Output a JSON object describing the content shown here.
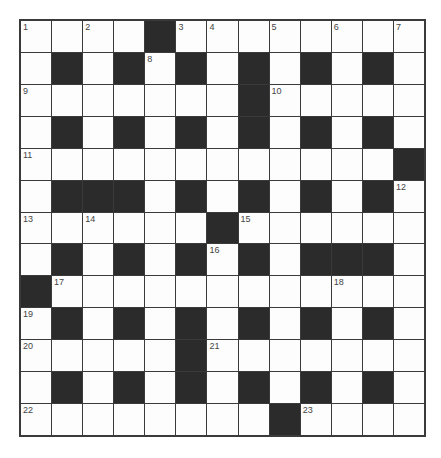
{
  "puzzle": {
    "type": "crossword",
    "rows": 13,
    "cols": 13,
    "colors": {
      "black_cell": "#2b2b2b",
      "white_cell": "#fdfdfd",
      "grid_line": "#3a3a3a",
      "number_text": "#444444"
    },
    "grid": [
      "....#........",
      ".#.#.#.#.#.#.",
      ".......#.....",
      ".#.#.#.#.#.#.",
      "............#",
      ".###.#.#.#.#.",
      "......#......",
      ".#.#.#.#.###.",
      "#............",
      ".#.#.#.#.#.#.",
      ".....#.......",
      ".#.#.#.#.#.#.",
      "........#...."
    ],
    "numbers": [
      {
        "row": 0,
        "col": 0,
        "n": "1"
      },
      {
        "row": 0,
        "col": 2,
        "n": "2"
      },
      {
        "row": 0,
        "col": 5,
        "n": "3"
      },
      {
        "row": 0,
        "col": 6,
        "n": "4"
      },
      {
        "row": 0,
        "col": 8,
        "n": "5"
      },
      {
        "row": 0,
        "col": 10,
        "n": "6"
      },
      {
        "row": 0,
        "col": 12,
        "n": "7"
      },
      {
        "row": 1,
        "col": 4,
        "n": "8"
      },
      {
        "row": 2,
        "col": 0,
        "n": "9"
      },
      {
        "row": 2,
        "col": 8,
        "n": "10"
      },
      {
        "row": 4,
        "col": 0,
        "n": "11"
      },
      {
        "row": 5,
        "col": 12,
        "n": "12"
      },
      {
        "row": 6,
        "col": 0,
        "n": "13"
      },
      {
        "row": 6,
        "col": 2,
        "n": "14"
      },
      {
        "row": 6,
        "col": 7,
        "n": "15"
      },
      {
        "row": 7,
        "col": 6,
        "n": "16"
      },
      {
        "row": 8,
        "col": 1,
        "n": "17"
      },
      {
        "row": 8,
        "col": 10,
        "n": "18"
      },
      {
        "row": 9,
        "col": 0,
        "n": "19"
      },
      {
        "row": 10,
        "col": 0,
        "n": "20"
      },
      {
        "row": 10,
        "col": 6,
        "n": "21"
      },
      {
        "row": 12,
        "col": 0,
        "n": "22"
      },
      {
        "row": 12,
        "col": 9,
        "n": "23"
      }
    ]
  }
}
